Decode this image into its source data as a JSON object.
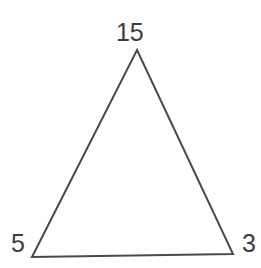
{
  "figure": {
    "type": "triangle",
    "background_color": "#ffffff",
    "stroke_color": "#4a4a4a",
    "stroke_width": 2,
    "label_color": "#3d3d3d",
    "vertices": [
      {
        "id": "apex",
        "label": "15",
        "x": 137,
        "y": 50
      },
      {
        "id": "bottom-right",
        "label": "3",
        "x": 233,
        "y": 254
      },
      {
        "id": "bottom-left",
        "label": "5",
        "x": 32,
        "y": 257
      }
    ],
    "polygon_points": "137,50 233,254 32,257",
    "labels": {
      "apex": "15",
      "bottom_left": "5",
      "bottom_right": "3"
    }
  }
}
